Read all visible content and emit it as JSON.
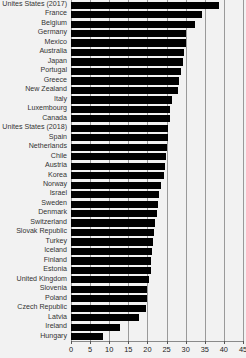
{
  "chart_data": {
    "type": "bar",
    "orientation": "horizontal",
    "title": "",
    "subtitle": "",
    "xlabel": "",
    "ylabel": "",
    "xlim": [
      0,
      45
    ],
    "ylim": [
      0,
      30
    ],
    "grid": true,
    "legend": false,
    "legend_position": "none",
    "xticks": [
      0,
      5,
      10,
      15,
      20,
      25,
      30,
      35,
      40,
      45
    ],
    "xtick_labels": [
      "0",
      "5",
      "10",
      "15",
      "20",
      "25",
      "30",
      "35",
      "40",
      "45"
    ],
    "bar_color": "#000000",
    "background_color": "#f2f2f2",
    "gridline_color": "#9a9a9a",
    "categories": [
      "Unites States (2017)",
      "France",
      "Belgium",
      "Germany",
      "Mexico",
      "Australia",
      "Japan",
      "Portugal",
      "Greece",
      "New Zealand",
      "Italy",
      "Luxembourg",
      "Canada",
      "Unites States (2018)",
      "Spain",
      "Netherlands",
      "Chile",
      "Austria",
      "Korea",
      "Norway",
      "Israel",
      "Sweden",
      "Denmark",
      "Switzerland",
      "Slovak Republic",
      "Turkey",
      "Iceland",
      "Finland",
      "Estonia",
      "United Kingdom",
      "Slovenia",
      "Poland",
      "Czech Republic",
      "Latvia",
      "Ireland",
      "Hungary"
    ],
    "values": [
      38.8,
      34.2,
      32.5,
      30.0,
      30.0,
      29.5,
      29.3,
      28.8,
      28.3,
      28.0,
      26.5,
      26.0,
      25.8,
      25.5,
      25.3,
      25.0,
      24.8,
      24.5,
      24.3,
      23.5,
      23.0,
      22.8,
      22.5,
      22.0,
      21.8,
      21.5,
      21.3,
      21.0,
      20.8,
      20.5,
      20.0,
      19.8,
      19.5,
      17.8,
      12.8,
      8.3
    ]
  }
}
